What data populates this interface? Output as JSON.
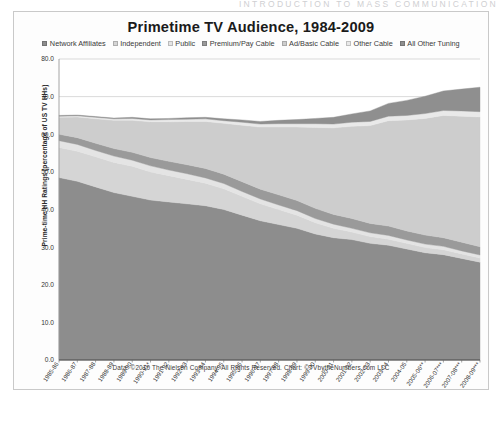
{
  "page": {
    "running_head": "INTRODUCTION TO MASS COMMUNICATION"
  },
  "chart": {
    "title": "Primetime TV Audience, 1984-2009",
    "ylabel": "Prime-time HH Ratings (percentage of US TV HHs)",
    "xlabel": "",
    "footer": "Data: ©2010 The Nielsen Company. All Rights Reserved. Chart: ©TVbytheNumbers.com LLC",
    "frame_color": "#c9c9c9",
    "grid": true,
    "legend_position": "top"
  },
  "chart_data": {
    "type": "area",
    "stacked": true,
    "title": "Primetime TV Audience, 1984-2009",
    "xlabel": "",
    "ylabel": "Prime-time HH Ratings (percentage of US TV HHs)",
    "ylim": [
      0,
      80
    ],
    "yticks": [
      "0.0",
      "10.0",
      "20.0",
      "30.0",
      "40.0",
      "50.0",
      "60.0",
      "70.0",
      "80.0"
    ],
    "grid": true,
    "legend_position": "top",
    "categories": [
      "1985-86",
      "1986-87",
      "1987-88",
      "1988-89",
      "1989-90",
      "1990-91*",
      "1991-92",
      "1992-93",
      "1993-94",
      "1994-95",
      "1995-96",
      "1996-97",
      "1997-98",
      "1998-99",
      "1999-00",
      "2000-01",
      "2001-02",
      "2002-03",
      "2003-04",
      "2004-05",
      "2005-06**",
      "2006-07***",
      "2007-08***",
      "2008-09***"
    ],
    "series": [
      {
        "name": "Network Affiliates",
        "color": "#8d8d8d",
        "values": [
          48.5,
          47.5,
          46.0,
          44.5,
          43.5,
          42.5,
          42.0,
          41.5,
          41.0,
          40.0,
          38.5,
          37.0,
          36.0,
          35.0,
          33.5,
          32.5,
          32.0,
          31.0,
          30.5,
          29.5,
          28.5,
          28.0,
          27.0,
          26.0
        ]
      },
      {
        "name": "Independent",
        "color": "#d5d5d5",
        "values": [
          8.0,
          8.0,
          8.0,
          8.0,
          8.0,
          7.5,
          7.0,
          6.5,
          6.0,
          5.5,
          5.0,
          4.5,
          4.0,
          3.5,
          3.0,
          2.5,
          2.0,
          1.8,
          1.6,
          1.5,
          1.4,
          1.3,
          1.2,
          1.1
        ]
      },
      {
        "name": "Public",
        "color": "#e4e4e4",
        "values": [
          1.8,
          1.8,
          1.7,
          1.7,
          1.6,
          1.6,
          1.5,
          1.5,
          1.4,
          1.4,
          1.3,
          1.3,
          1.2,
          1.2,
          1.1,
          1.1,
          1.0,
          1.0,
          1.0,
          0.9,
          0.9,
          0.9,
          0.8,
          0.8
        ]
      },
      {
        "name": "Premium/Pay Cable",
        "color": "#9a9a9a",
        "values": [
          1.7,
          1.8,
          1.9,
          2.0,
          2.1,
          2.2,
          2.3,
          2.4,
          2.5,
          2.5,
          2.6,
          2.6,
          2.7,
          2.7,
          2.7,
          2.6,
          2.6,
          2.5,
          2.5,
          2.4,
          2.4,
          2.3,
          2.3,
          2.2
        ]
      },
      {
        "name": "Ad/Basic Cable",
        "color": "#cdcdcd",
        "values": [
          4.5,
          5.5,
          6.5,
          7.5,
          8.5,
          9.5,
          10.5,
          11.5,
          12.5,
          13.5,
          15.0,
          16.5,
          18.0,
          19.5,
          21.5,
          23.0,
          24.5,
          26.0,
          28.0,
          29.5,
          31.0,
          32.5,
          33.5,
          34.5
        ]
      },
      {
        "name": "Other Cable",
        "color": "#e9e9e9",
        "values": [
          0.3,
          0.3,
          0.4,
          0.4,
          0.5,
          0.5,
          0.6,
          0.6,
          0.7,
          0.7,
          0.8,
          0.8,
          0.9,
          0.9,
          1.0,
          1.0,
          1.1,
          1.1,
          1.2,
          1.2,
          1.3,
          1.3,
          1.4,
          1.4
        ]
      },
      {
        "name": "All Other Tuning",
        "color": "#8f8f8f",
        "values": [
          0.2,
          0.2,
          0.2,
          0.2,
          0.3,
          0.3,
          0.3,
          0.4,
          0.4,
          0.5,
          0.6,
          0.7,
          0.9,
          1.1,
          1.4,
          1.8,
          2.2,
          2.8,
          3.4,
          4.0,
          4.6,
          5.2,
          5.8,
          6.5
        ]
      }
    ]
  }
}
